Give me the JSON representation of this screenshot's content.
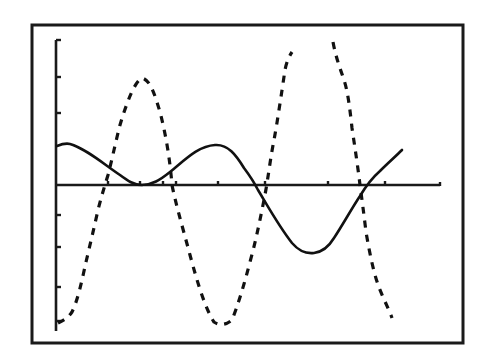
{
  "chart_data": {
    "type": "line",
    "title": "",
    "xlabel": "",
    "ylabel": "",
    "grid": false,
    "legend": null,
    "axes": {
      "x_ticks_count": 8,
      "y_ticks_above_axis": 3,
      "y_ticks_below_axis": 4,
      "tick_labels": []
    },
    "xlim": [
      0,
      10
    ],
    "ylim": [
      -4,
      4
    ],
    "series": [
      {
        "name": "solid-wave",
        "style": "solid",
        "color": "#111111",
        "x": [
          0.0,
          0.3,
          1.0,
          1.8,
          2.2,
          2.8,
          3.6,
          4.2,
          4.6,
          5.2,
          5.8,
          6.5,
          7.2,
          7.8,
          8.5,
          9.0
        ],
        "y": [
          1.0,
          1.05,
          0.6,
          0.05,
          0.0,
          0.45,
          1.0,
          0.75,
          0.0,
          -1.0,
          -1.75,
          -1.4,
          -0.2,
          0.5,
          0.95,
          0.9
        ]
      },
      {
        "name": "dashed-wave",
        "style": "dashed",
        "color": "#111111",
        "x": [
          0.0,
          0.6,
          1.2,
          1.7,
          2.2,
          2.7,
          3.2,
          3.8,
          4.3,
          4.8,
          5.3,
          5.7,
          6.2,
          6.5,
          7.0,
          7.6,
          8.1,
          8.6
        ],
        "y": [
          -3.8,
          -2.4,
          -0.2,
          2.4,
          2.9,
          1.5,
          -0.5,
          -2.6,
          -3.8,
          -2.2,
          0.0,
          2.0,
          3.5,
          4.2,
          3.8,
          0.5,
          -2.2,
          -3.6
        ]
      }
    ]
  },
  "render": {
    "frame": {
      "x": 32,
      "y": 25,
      "w": 431,
      "h": 318
    },
    "y_axis": {
      "x": 56,
      "y1": 40,
      "y2": 331
    },
    "x_axis": {
      "y": 185,
      "x1": 56,
      "x2": 440
    },
    "x_ticks": [
      108,
      140,
      163,
      176,
      218,
      265,
      328,
      385
    ],
    "y_ticks": [
      40,
      77,
      113,
      215,
      247,
      287,
      321
    ],
    "solid_path": "M57,146 C62,144 66,143 70,144 C85,148 105,165 120,175 C128,181 134,185 142,185 C152,185 160,180 170,172 C185,160 198,146 215,145 C228,144 236,155 244,168 C250,176 254,182 258,190 C266,203 278,225 292,243 C298,250 306,254 314,253 C322,252 328,248 334,238 C342,226 352,208 360,196 C366,186 372,178 380,171 C388,163 396,156 402,150",
    "dashed_path_1": "M58,323 C64,320 68,318 72,312 C78,300 82,280 86,262 C90,245 94,228 98,210 C101,198 104,188 108,175 C112,160 116,140 120,125 C126,105 134,82 142,78 C150,80 154,92 160,112 C166,135 170,160 172,185 C176,205 182,225 190,255 C198,285 206,310 214,322 C220,326 226,325 232,320 C238,305 244,285 250,262 C256,240 260,220 264,200 C268,180 270,160 274,140 C278,118 282,90 285,70 C287,60 290,55 292,52",
    "dashed_path_2": "M333,42 C336,58 340,68 344,80 C348,92 350,110 352,128 C355,148 358,168 360,185 C362,200 364,215 366,232 C370,255 374,275 380,290 C385,302 390,312 392,318"
  }
}
